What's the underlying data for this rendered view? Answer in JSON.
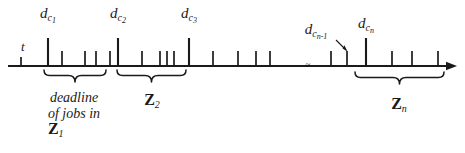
{
  "figure": {
    "type": "timeline-diagram",
    "colors": {
      "ink": "#1a1a1a",
      "background": "#ffffff"
    },
    "axis": {
      "y": 66,
      "x_start": 8,
      "x_end": 457,
      "arrow": true,
      "break_symbol": "≈",
      "break_x": 308
    },
    "origin_label": {
      "text": "t",
      "x": 21,
      "y": 40
    },
    "deadline_labels": [
      {
        "id": "dc1",
        "base": "d",
        "sub": "c",
        "subsub": "1",
        "x": 48,
        "y": 6,
        "tick_x": 48
      },
      {
        "id": "dc2",
        "base": "d",
        "sub": "c",
        "subsub": "2",
        "x": 118,
        "y": 6,
        "tick_x": 118
      },
      {
        "id": "dc3",
        "base": "d",
        "sub": "c",
        "subsub": "3",
        "x": 189,
        "y": 6,
        "tick_x": 189
      },
      {
        "id": "dcn1",
        "base": "d",
        "sub": "c",
        "subsub": "n-1",
        "x": 316,
        "y": 22,
        "tick_x": 347
      },
      {
        "id": "dcn",
        "base": "d",
        "sub": "c",
        "subsub": "n",
        "x": 366,
        "y": 16,
        "tick_x": 366
      }
    ],
    "ticks": [
      {
        "x": 21,
        "h": 9
      },
      {
        "x": 48,
        "h": 28
      },
      {
        "x": 62,
        "h": 15
      },
      {
        "x": 85,
        "h": 15
      },
      {
        "x": 96,
        "h": 15
      },
      {
        "x": 110,
        "h": 15
      },
      {
        "x": 118,
        "h": 28
      },
      {
        "x": 142,
        "h": 15
      },
      {
        "x": 160,
        "h": 15
      },
      {
        "x": 167,
        "h": 15
      },
      {
        "x": 174,
        "h": 15
      },
      {
        "x": 189,
        "h": 28
      },
      {
        "x": 213,
        "h": 15
      },
      {
        "x": 238,
        "h": 15
      },
      {
        "x": 256,
        "h": 15
      },
      {
        "x": 270,
        "h": 15
      },
      {
        "x": 331,
        "h": 15
      },
      {
        "x": 347,
        "h": 15
      },
      {
        "x": 366,
        "h": 28
      },
      {
        "x": 392,
        "h": 15
      },
      {
        "x": 412,
        "h": 15
      },
      {
        "x": 438,
        "h": 15
      }
    ],
    "braces": [
      {
        "id": "brace-z1",
        "x1": 44,
        "x2": 106,
        "y": 70,
        "depth": 10
      },
      {
        "id": "brace-z2",
        "x1": 117,
        "x2": 186,
        "y": 70,
        "depth": 10
      },
      {
        "id": "brace-zn",
        "x1": 355,
        "x2": 444,
        "y": 72,
        "depth": 10
      }
    ],
    "group_labels": [
      {
        "id": "z1",
        "lines": [
          "deadline",
          "of jobs in"
        ],
        "set": "Z",
        "sub": "1",
        "x": 74,
        "y": 90
      },
      {
        "id": "z2",
        "lines": [],
        "set": "Z",
        "sub": "2",
        "x": 152,
        "y": 92
      },
      {
        "id": "zn",
        "lines": [],
        "set": "Z",
        "sub": "n",
        "x": 399,
        "y": 96
      }
    ]
  }
}
